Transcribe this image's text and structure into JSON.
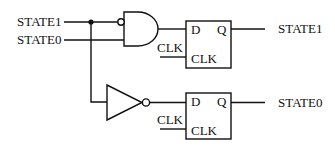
{
  "diagram": {
    "type": "logic-circuit",
    "inputs": [
      {
        "id": "in-state1",
        "label": "STATE1"
      },
      {
        "id": "in-state0",
        "label": "STATE0"
      }
    ],
    "gates": [
      {
        "id": "and-gate",
        "type": "AND",
        "inverted_inputs": [
          "STATE1"
        ],
        "inputs": [
          "STATE1",
          "STATE0"
        ]
      },
      {
        "id": "not-gate",
        "type": "NOT",
        "inputs": [
          "STATE1"
        ]
      }
    ],
    "flipflops": [
      {
        "id": "ff1",
        "pin_d": "D",
        "pin_q": "Q",
        "pin_clk": "CLK",
        "clk_input_label": "CLK",
        "output_label": "STATE1",
        "d_source": "and-gate"
      },
      {
        "id": "ff2",
        "pin_d": "D",
        "pin_q": "Q",
        "pin_clk": "CLK",
        "clk_input_label": "CLK",
        "output_label": "STATE0",
        "d_source": "not-gate"
      }
    ],
    "junctions": [
      {
        "at": "STATE1 branch"
      }
    ],
    "colors": {
      "line": "#111111",
      "background": "#ffffff"
    }
  }
}
